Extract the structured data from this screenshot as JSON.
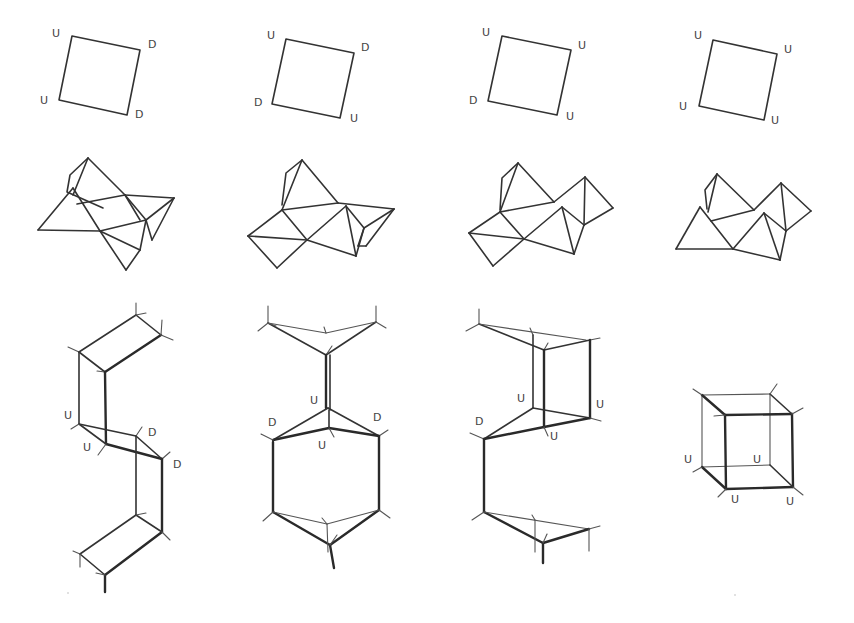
{
  "diagram": {
    "layout": {
      "columns": 4,
      "rows": 3
    },
    "colors": {
      "line": "#333333",
      "label": "#444444",
      "background": "#ffffff"
    },
    "panels": [
      {
        "column": 1,
        "square": {
          "labels": {
            "top_left": "U",
            "top_right": "D",
            "bottom_left": "U",
            "bottom_right": "D"
          }
        },
        "polyhedron": {
          "type": "folded-triangles"
        },
        "framework": {
          "type": "zigzag-chain",
          "labels": {
            "left_upper": "U",
            "left_lower": "U",
            "right_upper": "D",
            "right_lower": "D"
          }
        }
      },
      {
        "column": 2,
        "square": {
          "labels": {
            "top_left": "U",
            "top_right": "D",
            "bottom_left": "D",
            "bottom_right": "U"
          }
        },
        "polyhedron": {
          "type": "folded-triangles"
        },
        "framework": {
          "type": "hexagonal-cage",
          "labels": {
            "center_upper": "U",
            "left": "D",
            "right": "D",
            "center_lower": "U"
          }
        }
      },
      {
        "column": 3,
        "square": {
          "labels": {
            "top_left": "U",
            "top_right": "U",
            "bottom_left": "D",
            "bottom_right": "U"
          }
        },
        "polyhedron": {
          "type": "folded-triangles"
        },
        "framework": {
          "type": "open-cage",
          "labels": {
            "left": "D",
            "inner": "U",
            "front": "U",
            "right": "U"
          }
        }
      },
      {
        "column": 4,
        "square": {
          "labels": {
            "top_left": "U",
            "top_right": "U",
            "bottom_left": "U",
            "bottom_right": "U"
          }
        },
        "polyhedron": {
          "type": "folded-triangles"
        },
        "framework": {
          "type": "cube",
          "labels": {
            "left": "U",
            "inner": "U",
            "bottom_front": "U",
            "bottom_right": "U"
          }
        }
      }
    ]
  }
}
